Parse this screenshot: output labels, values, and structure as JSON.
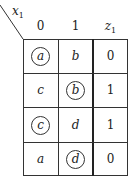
{
  "corner_label": {
    "var": "x",
    "sub": "1"
  },
  "columns": [
    {
      "label": "0",
      "italic": false
    },
    {
      "label": "1",
      "italic": false
    },
    {
      "label": "z",
      "sub": "1",
      "italic": true
    }
  ],
  "rows": [
    {
      "cells": [
        {
          "value": "a",
          "circled": true
        },
        {
          "value": "b",
          "circled": false
        },
        {
          "value": "0"
        }
      ]
    },
    {
      "cells": [
        {
          "value": "c",
          "circled": false
        },
        {
          "value": "b",
          "circled": true
        },
        {
          "value": "1"
        }
      ]
    },
    {
      "cells": [
        {
          "value": "c",
          "circled": true
        },
        {
          "value": "d",
          "circled": false
        },
        {
          "value": "1"
        }
      ]
    },
    {
      "cells": [
        {
          "value": "a",
          "circled": false
        },
        {
          "value": "d",
          "circled": true
        },
        {
          "value": "0"
        }
      ]
    }
  ]
}
